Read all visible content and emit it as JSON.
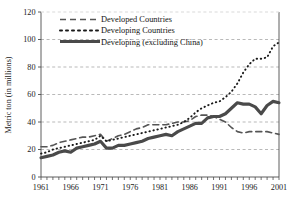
{
  "chart_data": {
    "type": "line",
    "title": "",
    "subtitle": "",
    "xlabel": "",
    "ylabel": "Metric ton (in millions)",
    "xlim": [
      1961,
      2001
    ],
    "ylim": [
      0,
      120
    ],
    "yticks": [
      0,
      20,
      40,
      60,
      80,
      100,
      120
    ],
    "xticks": [
      1961,
      1966,
      1971,
      1976,
      1981,
      1986,
      1991,
      1996,
      2001
    ],
    "xtick_labels": [
      "1961",
      "1966",
      "1971",
      "1976",
      "1981",
      "1986",
      "1991",
      "1996",
      "2001"
    ],
    "ytick_labels": [
      "0",
      "20",
      "40",
      "60",
      "80",
      "100",
      "120"
    ],
    "grid": true,
    "grid_axis": "y",
    "grid_style": "dashed",
    "legend_position": "top-left-inside",
    "x": [
      1961,
      1962,
      1963,
      1964,
      1965,
      1966,
      1967,
      1968,
      1969,
      1970,
      1971,
      1972,
      1973,
      1974,
      1975,
      1976,
      1977,
      1978,
      1979,
      1980,
      1981,
      1982,
      1983,
      1984,
      1985,
      1986,
      1987,
      1988,
      1989,
      1990,
      1991,
      1992,
      1993,
      1994,
      1995,
      1996,
      1997,
      1998,
      1999,
      2000,
      2001
    ],
    "series": [
      {
        "name": "Developed Countries",
        "style": "dashed",
        "color": "#555555",
        "width": 1.6,
        "values": [
          22,
          22,
          23,
          25,
          26,
          27,
          28,
          29,
          29,
          30,
          31,
          26,
          28,
          30,
          31,
          33,
          35,
          36,
          38,
          38,
          38,
          38,
          39,
          40,
          40,
          41,
          44,
          45,
          45,
          44,
          42,
          40,
          36,
          33,
          32,
          33,
          33,
          33,
          33,
          32,
          31
        ]
      },
      {
        "name": "Developing Countries",
        "style": "dotted",
        "color": "#1a1a1a",
        "width": 1.9,
        "values": [
          17,
          18,
          20,
          21,
          22,
          23,
          24,
          25,
          26,
          27,
          30,
          26,
          27,
          28,
          29,
          30,
          31,
          32,
          33,
          34,
          35,
          36,
          37,
          38,
          40,
          43,
          47,
          50,
          52,
          54,
          55,
          58,
          62,
          68,
          76,
          82,
          86,
          86,
          87,
          95,
          98
        ]
      },
      {
        "name": "Developing (excluding China)",
        "style": "solid",
        "color": "#4a4a4a",
        "width": 3.1,
        "values": [
          14,
          15,
          16,
          18,
          19,
          18,
          21,
          22,
          23,
          24,
          26,
          21,
          21,
          23,
          23,
          24,
          25,
          26,
          28,
          29,
          30,
          31,
          30,
          33,
          35,
          37,
          39,
          39,
          43,
          44,
          44,
          46,
          50,
          54,
          53,
          53,
          51,
          46,
          52,
          55,
          54
        ]
      }
    ],
    "legend_entries": [
      {
        "label": "Developed Countries",
        "style": "dashed"
      },
      {
        "label": "Developing Countries",
        "style": "dotted"
      },
      {
        "label": "Developing (excluding China)",
        "style": "solid"
      }
    ]
  },
  "colors": {
    "background": "#ffffff",
    "axis": "#4d4d4d",
    "grid": "#9b9b9b",
    "text": "#1a1a1a"
  }
}
